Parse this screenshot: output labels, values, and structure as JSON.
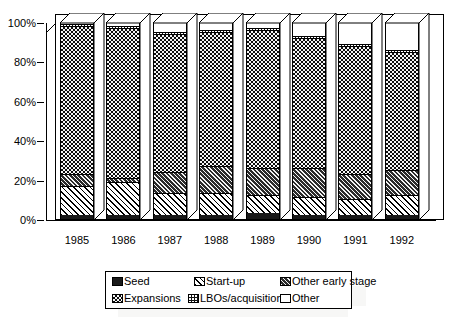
{
  "chart_data": {
    "type": "bar",
    "stacked": true,
    "normalized_percent": true,
    "title": "",
    "subtitle": "",
    "xlabel": "",
    "ylabel": "",
    "ylim": [
      0,
      100
    ],
    "ytick_labels": [
      "0%",
      "20%",
      "40%",
      "60%",
      "80%",
      "100%"
    ],
    "ytick_values": [
      0,
      20,
      40,
      60,
      80,
      100
    ],
    "grid": false,
    "legend_position": "bottom",
    "categories": [
      "1985",
      "1986",
      "1987",
      "1988",
      "1989",
      "1990",
      "1991",
      "1992"
    ],
    "series": [
      {
        "name": "Seed",
        "pattern": "solid-black",
        "values": [
          2,
          2,
          2,
          2,
          3,
          2,
          2,
          2
        ]
      },
      {
        "name": "Start-up",
        "pattern": "diagonal-hatch",
        "values": [
          15,
          17,
          11,
          11,
          9,
          9,
          8,
          10
        ]
      },
      {
        "name": "Other early stage",
        "pattern": "dense-diagonal",
        "values": [
          6,
          2,
          11,
          14,
          14,
          15,
          13,
          13
        ]
      },
      {
        "name": "Expansions",
        "pattern": "dots-on-black",
        "values": [
          75,
          76,
          70,
          68,
          70,
          66,
          65,
          60
        ]
      },
      {
        "name": "LBOs/acquisitions",
        "pattern": "fine-dots",
        "values": [
          1,
          1,
          1,
          1,
          1,
          1,
          1,
          1
        ]
      },
      {
        "name": "Other",
        "pattern": "white",
        "values": [
          1,
          2,
          5,
          4,
          3,
          7,
          11,
          14
        ]
      }
    ]
  },
  "axes": {
    "y_ticks": [
      {
        "label": "100%",
        "value": 100
      },
      {
        "label": "80%",
        "value": 80
      },
      {
        "label": "60%",
        "value": 60
      },
      {
        "label": "40%",
        "value": 40
      },
      {
        "label": "20%",
        "value": 20
      },
      {
        "label": "0%",
        "value": 0
      }
    ],
    "x_ticks": [
      {
        "label": "1985"
      },
      {
        "label": "1986"
      },
      {
        "label": "1987"
      },
      {
        "label": "1988"
      },
      {
        "label": "1989"
      },
      {
        "label": "1990"
      },
      {
        "label": "1991"
      },
      {
        "label": "1992"
      }
    ]
  },
  "legend": {
    "items": [
      {
        "label": "Seed",
        "swatch": "seed-swatch-icon",
        "pattern": "solid-black"
      },
      {
        "label": "Start-up",
        "swatch": "startup-swatch-icon",
        "pattern": "diagonal-hatch"
      },
      {
        "label": "Other early stage",
        "swatch": "earlystage-swatch-icon",
        "pattern": "dense-diagonal"
      },
      {
        "label": "Expansions",
        "swatch": "expansions-swatch-icon",
        "pattern": "dots-on-black"
      },
      {
        "label": "LBOs/acquisitions",
        "swatch": "lbos-swatch-icon",
        "pattern": "fine-dots"
      },
      {
        "label": "Other",
        "swatch": "other-swatch-icon",
        "pattern": "white"
      }
    ]
  },
  "colors": {
    "background": "#ffffff",
    "foreground": "#000000",
    "bar_dark": "#111111",
    "bar_light": "#ffffff"
  }
}
